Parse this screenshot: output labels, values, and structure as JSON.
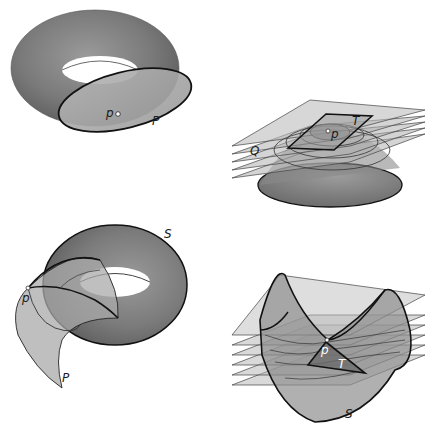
{
  "figure": {
    "panels": [
      {
        "id": "top-left",
        "description": "Torus with tangent plane P touching at point p",
        "labels": {
          "point": "p",
          "plane": "P"
        }
      },
      {
        "id": "top-right",
        "description": "Paraboloid cap with stacked level planes Q and tangent plane T at point p",
        "labels": {
          "point": "p",
          "tangent_plane": "T",
          "level_plane": "Q"
        }
      },
      {
        "id": "bottom-left",
        "description": "Torus S with tangent surface P touching at point p on inner side",
        "labels": {
          "surface": "S",
          "point": "p",
          "plane": "P"
        }
      },
      {
        "id": "bottom-right",
        "description": "Saddle surface S with stacked planes and tangent plane T at saddle point p",
        "labels": {
          "point": "p",
          "tangent_plane": "T",
          "surface": "S"
        }
      }
    ],
    "colors": {
      "surface_dark": "#6e6e6e",
      "surface_mid": "#8a8a8a",
      "surface_light": "#a8a8a8",
      "plane_fill": "#9a9a9a",
      "outline": "#111111",
      "background": "#ffffff"
    }
  }
}
